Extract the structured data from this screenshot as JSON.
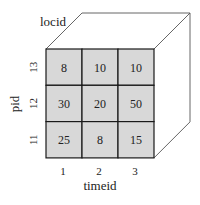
{
  "diagram": {
    "type": "data-cube",
    "depth_axis_label": "locid",
    "row_axis_label": "pid",
    "column_axis_label": "timeid",
    "row_labels": [
      "13",
      "12",
      "11"
    ],
    "column_labels": [
      "1",
      "2",
      "3"
    ],
    "cells": [
      [
        "8",
        "10",
        "10"
      ],
      [
        "30",
        "20",
        "50"
      ],
      [
        "25",
        "8",
        "15"
      ]
    ],
    "colors": {
      "cell_fill": "#d8d8d8",
      "grid_line": "#1a1a1a",
      "edge_line": "#555555"
    }
  }
}
